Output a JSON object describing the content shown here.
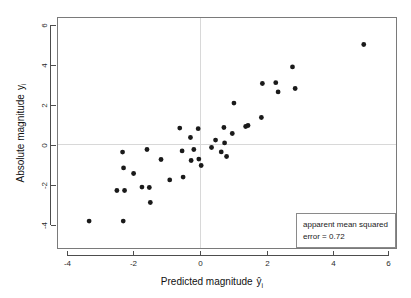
{
  "chart_data": {
    "type": "scatter",
    "title": "",
    "xlabel": "Predicted magnitude ŷi",
    "xlabel_main": "Predicted magnitude",
    "xlabel_symbol": "ŷ",
    "xlabel_subscript": "i",
    "ylabel": "Absolute magnitude yi",
    "ylabel_main": "Absolute magnitude",
    "ylabel_symbol": "y",
    "ylabel_subscript": "i",
    "xlim": [
      -4.6,
      6.2
    ],
    "ylim": [
      -4.8,
      6.4
    ],
    "xticks": [
      -4,
      -2,
      0,
      2,
      4,
      6
    ],
    "xtick_labels": [
      "-4",
      "-2",
      "0",
      "2",
      "4",
      "6"
    ],
    "yticks": [
      -4,
      -2,
      0,
      2,
      4,
      6
    ],
    "ytick_labels": [
      "-4",
      "-2",
      "0",
      "2",
      "4",
      "6"
    ],
    "grid": true,
    "gridlines": {
      "vertical_at_x": 0,
      "horizontal_at_y": 0
    },
    "legend_position": "bottom-right",
    "marker": {
      "shape": "circle",
      "color": "#1a1a1a",
      "size": 2.4
    },
    "points": [
      {
        "x": -3.33,
        "y": -3.78
      },
      {
        "x": -2.5,
        "y": -2.25
      },
      {
        "x": -2.33,
        "y": -0.33
      },
      {
        "x": -2.31,
        "y": -3.78
      },
      {
        "x": -2.27,
        "y": -2.25
      },
      {
        "x": -2.3,
        "y": -1.12
      },
      {
        "x": -2.0,
        "y": -1.4
      },
      {
        "x": -1.75,
        "y": -2.08
      },
      {
        "x": -1.6,
        "y": -0.2
      },
      {
        "x": -1.53,
        "y": -2.1
      },
      {
        "x": -1.5,
        "y": -2.85
      },
      {
        "x": -1.18,
        "y": -0.7
      },
      {
        "x": -0.92,
        "y": -1.72
      },
      {
        "x": -0.62,
        "y": 0.87
      },
      {
        "x": -0.55,
        "y": -0.27
      },
      {
        "x": -0.52,
        "y": -1.58
      },
      {
        "x": -0.3,
        "y": 0.4
      },
      {
        "x": -0.28,
        "y": -0.75
      },
      {
        "x": -0.2,
        "y": -0.2
      },
      {
        "x": -0.07,
        "y": 0.84
      },
      {
        "x": -0.05,
        "y": -0.68
      },
      {
        "x": 0.02,
        "y": -1.0
      },
      {
        "x": 0.33,
        "y": -0.1
      },
      {
        "x": 0.45,
        "y": 0.27
      },
      {
        "x": 0.62,
        "y": -0.32
      },
      {
        "x": 0.7,
        "y": 0.9
      },
      {
        "x": 0.72,
        "y": 0.13
      },
      {
        "x": 0.78,
        "y": -0.55
      },
      {
        "x": 0.95,
        "y": 0.6
      },
      {
        "x": 1.0,
        "y": 2.12
      },
      {
        "x": 1.35,
        "y": 0.95
      },
      {
        "x": 1.42,
        "y": 1.0
      },
      {
        "x": 1.82,
        "y": 1.4
      },
      {
        "x": 1.85,
        "y": 3.1
      },
      {
        "x": 2.25,
        "y": 3.14
      },
      {
        "x": 2.32,
        "y": 2.68
      },
      {
        "x": 2.75,
        "y": 3.93
      },
      {
        "x": 2.83,
        "y": 2.85
      },
      {
        "x": 4.88,
        "y": 5.05
      }
    ],
    "annotation": {
      "line1": "apparent mean squared",
      "line2": "error = 0.72",
      "value": 0.72
    }
  },
  "colors": {
    "background": "#ffffff",
    "frame": "#7a7a7a",
    "grid": "#d8d8d8",
    "marker": "#1a1a1a",
    "text": "#111111"
  }
}
